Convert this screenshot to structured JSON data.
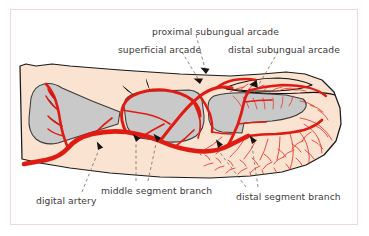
{
  "figure": {
    "frame_color": "#f0d8d8",
    "background": "#ffffff"
  },
  "palette": {
    "skin": "#fae3d0",
    "skin_outline": "#1a1a1a",
    "bone": "#c9c9c9",
    "bone_outline": "#3a3a3a",
    "artery": "#e01b14",
    "capillary": "#e2382c",
    "nail": "#f7e0cd",
    "text": "#3c3a38",
    "leader": "#6f6c6a",
    "arrow": "#141414"
  },
  "labels": [
    {
      "id": "proximal-subungual-arcade",
      "text": "proximal subungual arcade",
      "x": 152,
      "y": 27
    },
    {
      "id": "superficial-arcade",
      "text": "superficial arcade",
      "x": 118,
      "y": 45
    },
    {
      "id": "distal-subungual-arcade",
      "text": "distal subungual arcade",
      "x": 228,
      "y": 45
    },
    {
      "id": "digital-artery",
      "text": "digital artery",
      "x": 36,
      "y": 196
    },
    {
      "id": "middle-segment-branch",
      "text": "middle segment branch",
      "x": 101,
      "y": 186
    },
    {
      "id": "distal-segment-branch",
      "text": "distal segment branch",
      "x": 236,
      "y": 192
    }
  ],
  "anatomy": {
    "bones": [
      {
        "name": "proximal-phalanx"
      },
      {
        "name": "middle-phalanx"
      },
      {
        "name": "distal-phalanx"
      }
    ],
    "nail": {
      "name": "nail-plate"
    },
    "vessels": [
      {
        "name": "digital-artery-trunk"
      },
      {
        "name": "middle-segment-branch-vessel"
      },
      {
        "name": "distal-segment-branch-vessel"
      },
      {
        "name": "superficial-arcade-vessel"
      },
      {
        "name": "proximal-subungual-arcade-vessel"
      },
      {
        "name": "distal-subungual-arcade-vessel"
      },
      {
        "name": "pulp-capillary-network"
      }
    ]
  }
}
